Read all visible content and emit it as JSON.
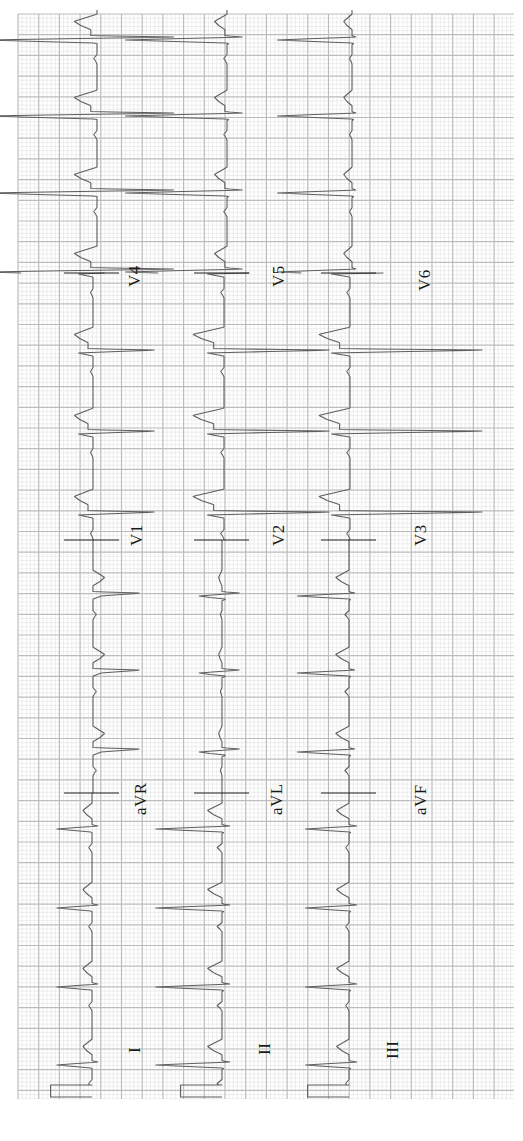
{
  "chart_data": {
    "type": "line",
    "title": "",
    "paper": {
      "background": "#ffffff",
      "minor_grid_color": "#e2e2e2",
      "major_grid_color": "#bcbcbc",
      "trace_color": "#5e5e5e",
      "separator_color": "#1e1e1e",
      "small_box_mm": 1,
      "large_box_mm": 5,
      "paper_speed_mm_per_s": 25,
      "gain_mm_per_mV": 10
    },
    "grid_px": {
      "x0": 18,
      "x1": 514,
      "y0": 14,
      "y1": 1099,
      "major": 20.7
    },
    "layout_rows": [
      [
        "I",
        "aVR",
        "V1",
        "V4"
      ],
      [
        "II",
        "aVL",
        "V2",
        "V5"
      ],
      [
        "III",
        "aVF",
        "V3",
        "V6"
      ]
    ],
    "calibration_pulse": {
      "amplitude_mV": 1.0,
      "width_ms": 200
    },
    "rhythm": {
      "rr_ms": 760,
      "heart_rate_bpm": 79
    },
    "leads": [
      {
        "name": "I",
        "row": 0,
        "col": 0,
        "baseline_x": 92,
        "label_x": 128,
        "label_y": 1053,
        "p": 0.08,
        "q": 0,
        "r": 0.85,
        "s": -0.15,
        "t": 0.22,
        "st": 0.0
      },
      {
        "name": "II",
        "row": 1,
        "col": 0,
        "baseline_x": 222,
        "label_x": 258,
        "label_y": 1055,
        "p": 0.12,
        "q": -0.05,
        "r": 1.6,
        "s": -0.2,
        "t": 0.35,
        "st": 0.0
      },
      {
        "name": "III",
        "row": 2,
        "col": 0,
        "baseline_x": 349,
        "label_x": 386,
        "label_y": 1059,
        "p": 0.08,
        "q": -0.05,
        "r": 1.05,
        "s": -0.2,
        "t": 0.3,
        "st": 0.0
      },
      {
        "name": "aVR",
        "row": 0,
        "col": 1,
        "baseline_x": 93,
        "label_x": 134,
        "label_y": 815,
        "p": -0.08,
        "q": 0,
        "r": -0.2,
        "s": -1.2,
        "t": -0.28,
        "st": 0.0
      },
      {
        "name": "aVL",
        "row": 1,
        "col": 1,
        "baseline_x": 222,
        "label_x": 270,
        "label_y": 815,
        "p": 0.04,
        "q": -0.1,
        "r": 0.55,
        "s": -0.45,
        "t": 0.08,
        "st": 0.0
      },
      {
        "name": "aVF",
        "row": 2,
        "col": 1,
        "baseline_x": 349,
        "label_x": 414,
        "label_y": 815,
        "p": 0.1,
        "q": -0.05,
        "r": 1.25,
        "s": -0.15,
        "t": 0.32,
        "st": 0.0
      },
      {
        "name": "V1",
        "row": 0,
        "col": 2,
        "baseline_x": 93,
        "label_x": 130,
        "label_y": 546,
        "p": 0.06,
        "q": 0,
        "r": 0.35,
        "s": -1.6,
        "t": 0.45,
        "st": 0.12
      },
      {
        "name": "V2",
        "row": 1,
        "col": 2,
        "baseline_x": 224,
        "label_x": 272,
        "label_y": 546,
        "p": 0.08,
        "q": 0,
        "r": 0.4,
        "s": -2.75,
        "t": 0.75,
        "st": 0.25
      },
      {
        "name": "V3",
        "row": 2,
        "col": 2,
        "baseline_x": 350,
        "label_x": 414,
        "label_y": 546,
        "p": 0.08,
        "q": 0,
        "r": 0.45,
        "s": -3.45,
        "t": 0.75,
        "st": 0.25
      },
      {
        "name": "V4",
        "row": 0,
        "col": 3,
        "baseline_x": 97,
        "label_x": 128,
        "label_y": 287,
        "p": 0.08,
        "q": 0,
        "r": 2.7,
        "s": -2.0,
        "t": 0.55,
        "st": 0.15
      },
      {
        "name": "V5",
        "row": 1,
        "col": 3,
        "baseline_x": 227,
        "label_x": 272,
        "label_y": 287,
        "p": 0.08,
        "q": -0.05,
        "r": 2.45,
        "s": -0.4,
        "t": 0.3,
        "st": 0.05
      },
      {
        "name": "V6",
        "row": 2,
        "col": 3,
        "baseline_x": 352,
        "label_x": 418,
        "label_y": 291,
        "p": 0.06,
        "q": -0.05,
        "r": 1.8,
        "s": -0.1,
        "t": 0.2,
        "st": 0.0
      }
    ],
    "sections": [
      {
        "col": 0,
        "y_start": 1099,
        "y_end": 793,
        "beats_y": [
          908,
          829
        ],
        "cal": true
      },
      {
        "col": 1,
        "y_start": 793,
        "y_end": 540,
        "beats_y": [
          752,
          673,
          596
        ]
      },
      {
        "col": 2,
        "y_start": 540,
        "y_end": 273,
        "beats_y": [
          515,
          434,
          353
        ]
      },
      {
        "col": 3,
        "y_start": 273,
        "y_end": 10,
        "beats_y": [
          193,
          116,
          40
        ]
      }
    ],
    "separators_y": [
      793,
      540,
      273
    ],
    "xlabel": "time (rotated, runs bottom to top)",
    "ylabel": "mV",
    "legend": []
  }
}
